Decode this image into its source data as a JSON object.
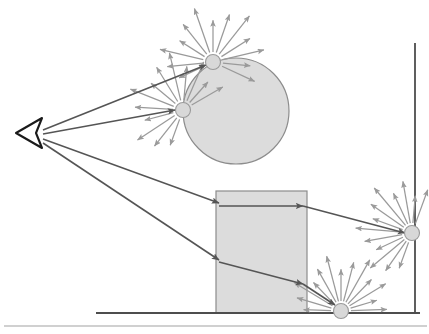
{
  "figure": {
    "width": 429,
    "height": 334,
    "background_color": "#ffffff"
  },
  "colors": {
    "scene_outline": "#8c8c8c",
    "scene_fill": "#dcdcdc",
    "primary_ray": "#555555",
    "scatter_ray": "#9a9a9a",
    "ground_line": "#4d4d4d",
    "wall_line": "#4d4d4d",
    "frame_line": "#c0c0c0",
    "eye_color": "#1a1a1a",
    "node_fill": "#d8d8d8",
    "node_stroke": "#9a9a9a"
  },
  "viewer": {
    "label": "eye",
    "apex_x": 16,
    "apex_y": 133,
    "back_x": 42,
    "back_y": 118,
    "back_y2": 148
  },
  "geometry": {
    "sphere": {
      "label": "sphere",
      "cx": 236,
      "cy": 111,
      "r": 53,
      "fill": "#dcdcdc",
      "stroke": "#8c8c8c"
    },
    "box": {
      "label": "box",
      "x": 216,
      "y": 191,
      "width": 91,
      "height": 122,
      "fill": "#dcdcdc",
      "stroke": "#8c8c8c"
    },
    "ground": {
      "label": "floor",
      "x1": 96,
      "y1": 313,
      "x2": 420,
      "y2": 313
    },
    "wall": {
      "label": "wall",
      "x1": 415,
      "y1": 43,
      "x2": 415,
      "y2": 313
    },
    "frame_bottom": {
      "label": "frame-bottom-rule",
      "x1": 4,
      "y1": 326,
      "x2": 427,
      "y2": 326
    }
  },
  "scatter_nodes": [
    {
      "id": "node-sphere-top",
      "label": "sphere top hit point",
      "cx": 213,
      "cy": 62,
      "r": 7.5,
      "ray_count": 13,
      "ray_length": 52
    },
    {
      "id": "node-sphere-left",
      "label": "sphere left hit point",
      "cx": 183,
      "cy": 110,
      "r": 7.5,
      "ray_count": 13,
      "ray_length": 52
    },
    {
      "id": "node-wall-right",
      "label": "wall hit point",
      "cx": 412,
      "cy": 233,
      "r": 7.5,
      "ray_count": 13,
      "ray_length": 52
    },
    {
      "id": "node-floor-bottom",
      "label": "floor hit point",
      "cx": 341,
      "cy": 311,
      "r": 7.5,
      "ray_count": 13,
      "ray_length": 52
    }
  ],
  "primary_rays": [
    {
      "id": "ray-eye-to-sphere-top",
      "label": "eye to sphere top",
      "x1": 43,
      "y1": 130,
      "x2": 206,
      "y2": 65,
      "arrow": true
    },
    {
      "id": "ray-eye-to-sphere-left",
      "label": "eye to sphere left",
      "x1": 43,
      "y1": 134,
      "x2": 175,
      "y2": 110,
      "arrow": true
    },
    {
      "id": "ray-eye-to-box-top",
      "label": "eye to box upper",
      "x1": 43,
      "y1": 139,
      "x2": 219,
      "y2": 203,
      "arrow": true
    },
    {
      "id": "ray-eye-to-box-lower",
      "label": "eye to box lower",
      "x1": 43,
      "y1": 143,
      "x2": 219,
      "y2": 260,
      "arrow": true
    }
  ],
  "secondary_rays": [
    {
      "id": "ray-box-top-to-wall",
      "label": "box upper to wall",
      "x1": 219,
      "y1": 206,
      "x2": 405,
      "y2": 233,
      "arrow": true,
      "mid_arrow_x": 303,
      "mid_arrow_y": 206
    },
    {
      "id": "ray-box-lower-to-floor",
      "label": "box lower to floor",
      "x1": 219,
      "y1": 262,
      "x2": 335,
      "y2": 305,
      "arrow": true,
      "mid_arrow_x": 303,
      "mid_arrow_y": 284
    }
  ],
  "annotations": {
    "caption": ""
  }
}
